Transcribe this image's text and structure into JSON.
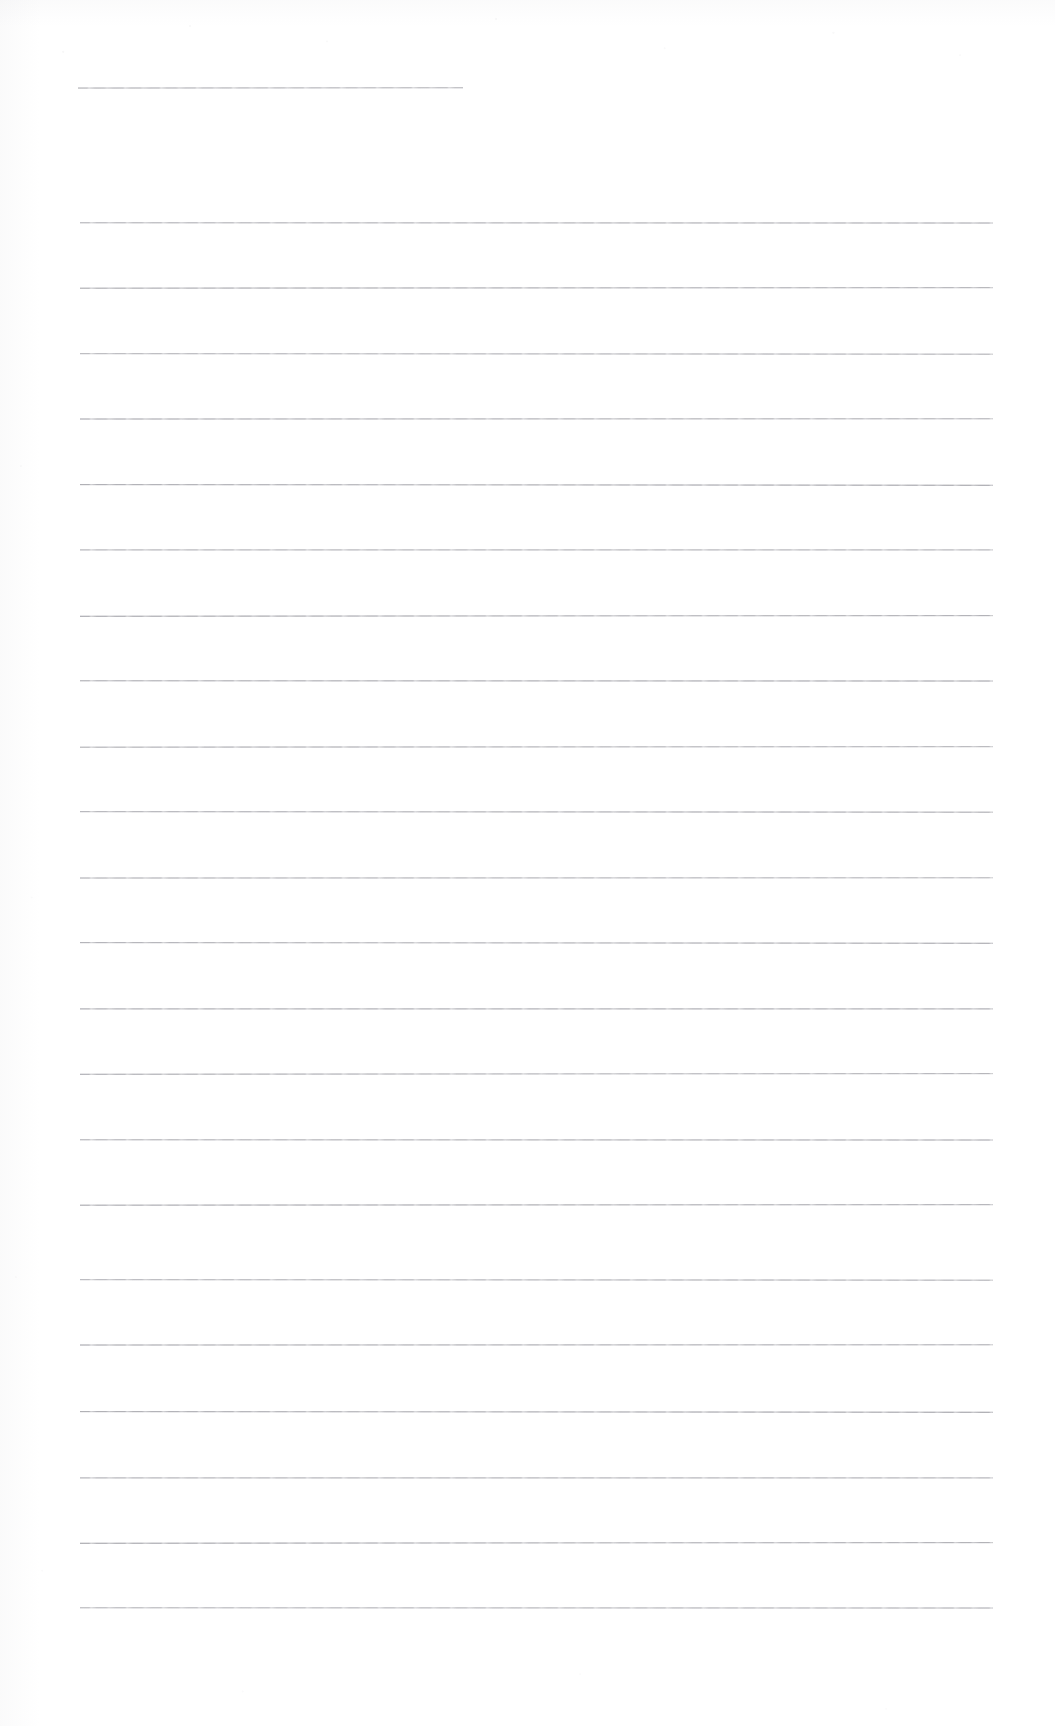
{
  "document": {
    "type": "scanned-blank-lined-page",
    "title": "",
    "page_width": 1055,
    "page_height": 1726,
    "background_color": "#ffffff",
    "rule_color": "#6c6c76",
    "body_text": "",
    "visible_text": []
  },
  "layout": {
    "left_margin_x": 80,
    "right_margin_x": 993,
    "header_rule": {
      "label": "header-rule",
      "x": 78,
      "y": 88,
      "width": 385
    },
    "body_rule_first_y": 223,
    "body_rule_spacing": 65.5,
    "body_rule_count": 22
  },
  "rules": [
    {
      "id": "rule-header",
      "y": 88,
      "x": 78,
      "width": 385,
      "full_width": false
    },
    {
      "id": "rule-01",
      "y": 223,
      "x": 80,
      "width": 913,
      "full_width": true
    },
    {
      "id": "rule-02",
      "y": 288,
      "x": 80,
      "width": 913,
      "full_width": true
    },
    {
      "id": "rule-03",
      "y": 354,
      "x": 80,
      "width": 913,
      "full_width": true
    },
    {
      "id": "rule-04",
      "y": 419,
      "x": 80,
      "width": 913,
      "full_width": true
    },
    {
      "id": "rule-05",
      "y": 485,
      "x": 80,
      "width": 913,
      "full_width": true
    },
    {
      "id": "rule-06",
      "y": 550,
      "x": 80,
      "width": 913,
      "full_width": true
    },
    {
      "id": "rule-07",
      "y": 616,
      "x": 80,
      "width": 913,
      "full_width": true
    },
    {
      "id": "rule-08",
      "y": 681,
      "x": 80,
      "width": 913,
      "full_width": true
    },
    {
      "id": "rule-09",
      "y": 747,
      "x": 80,
      "width": 913,
      "full_width": true
    },
    {
      "id": "rule-10",
      "y": 812,
      "x": 80,
      "width": 913,
      "full_width": true
    },
    {
      "id": "rule-11",
      "y": 878,
      "x": 80,
      "width": 913,
      "full_width": true
    },
    {
      "id": "rule-12",
      "y": 943,
      "x": 80,
      "width": 913,
      "full_width": true
    },
    {
      "id": "rule-13",
      "y": 1009,
      "x": 80,
      "width": 913,
      "full_width": true
    },
    {
      "id": "rule-14",
      "y": 1074,
      "x": 80,
      "width": 913,
      "full_width": true
    },
    {
      "id": "rule-15",
      "y": 1140,
      "x": 80,
      "width": 913,
      "full_width": true
    },
    {
      "id": "rule-16",
      "y": 1205,
      "x": 80,
      "width": 913,
      "full_width": true
    },
    {
      "id": "rule-17",
      "y": 1280,
      "x": 80,
      "width": 913,
      "full_width": true
    },
    {
      "id": "rule-18",
      "y": 1345,
      "x": 80,
      "width": 913,
      "full_width": true
    },
    {
      "id": "rule-19",
      "y": 1412,
      "x": 80,
      "width": 913,
      "full_width": true
    },
    {
      "id": "rule-20",
      "y": 1478,
      "x": 80,
      "width": 913,
      "full_width": true
    },
    {
      "id": "rule-21",
      "y": 1543,
      "x": 80,
      "width": 913,
      "full_width": true
    },
    {
      "id": "rule-22",
      "y": 1608,
      "x": 80,
      "width": 913,
      "full_width": true
    }
  ]
}
